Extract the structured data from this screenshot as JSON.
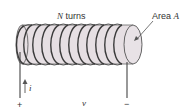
{
  "diagram": {
    "labels": {
      "turns_symbol": "N",
      "turns_text": " turns",
      "area_text": "Area ",
      "area_symbol": "A",
      "current_symbol": "i",
      "voltage_symbol": "v",
      "plus": "+",
      "minus": "−"
    },
    "coil": {
      "turn_count": 11
    },
    "colors": {
      "core_fill": "#e6dfe3",
      "core_stroke": "#555555",
      "wire": "#444444",
      "text": "#333333"
    }
  }
}
